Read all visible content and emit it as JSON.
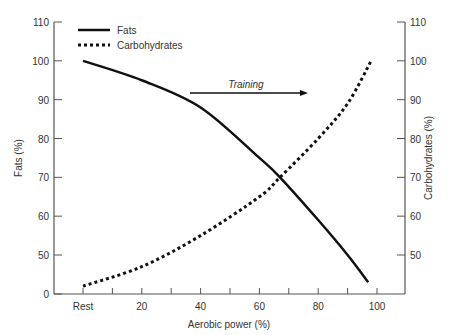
{
  "chart_data": {
    "type": "line",
    "title": "",
    "xlabel": "Aerobic power (%)",
    "ylabel_left": "Fats (%)",
    "ylabel_right": "Carbohydrates (%)",
    "x_ticks": [
      "Rest",
      "20",
      "40",
      "60",
      "80",
      "100"
    ],
    "y_ticks_left": [
      "0",
      "50",
      "60",
      "70",
      "80",
      "90",
      "100",
      "110"
    ],
    "y_ticks_right": [
      "50",
      "60",
      "70",
      "80",
      "90",
      "100",
      "110"
    ],
    "xlim": [
      0,
      110
    ],
    "ylim": [
      0,
      110
    ],
    "axis_break": "left y-axis jumps from 0 to 50",
    "legend": [
      "Fats",
      "Carbohydrates"
    ],
    "legend_position": "upper left",
    "annotation": {
      "text": "Training",
      "arrow": "right",
      "x_range": [
        38,
        79
      ],
      "y": 94
    },
    "series": [
      {
        "name": "Fats",
        "style": "solid",
        "x": [
          0,
          20,
          40,
          60,
          67,
          80,
          90,
          97
        ],
        "values": [
          100,
          95,
          88,
          75,
          70,
          59,
          50,
          43
        ]
      },
      {
        "name": "Carbohydrates",
        "style": "dotted",
        "x": [
          0,
          20,
          40,
          60,
          67,
          80,
          90,
          98
        ],
        "values": [
          42,
          47,
          55,
          65,
          70,
          80,
          89,
          100
        ]
      }
    ]
  }
}
